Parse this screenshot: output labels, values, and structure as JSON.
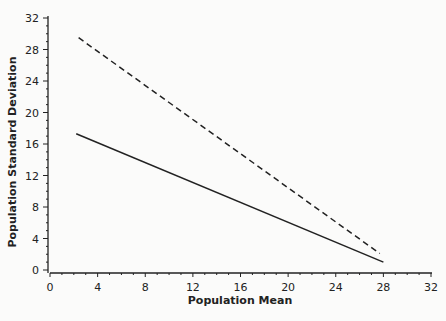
{
  "chart_data": {
    "type": "line",
    "title": "",
    "xlabel": "Population Mean",
    "ylabel": "Population Standard Deviation",
    "xlim": [
      0,
      32
    ],
    "ylim": [
      0,
      32
    ],
    "x_ticks": [
      0,
      4,
      8,
      12,
      16,
      20,
      24,
      28,
      32
    ],
    "y_ticks": [
      0,
      4,
      8,
      12,
      16,
      20,
      24,
      28,
      32
    ],
    "x_tick_labels": [
      "0",
      "4",
      "8",
      "12",
      "16",
      "20",
      "24",
      "28",
      "32"
    ],
    "y_tick_labels": [
      "0",
      "4",
      "8",
      "12",
      "16",
      "20",
      "24",
      "28",
      "32"
    ],
    "minor_tick_step": 1,
    "grid": false,
    "legend": null,
    "series": [
      {
        "name": "dashed",
        "style": "dashed",
        "color": "#222222",
        "x": [
          2.4,
          27.7
        ],
        "y": [
          29.5,
          2.1
        ]
      },
      {
        "name": "solid",
        "style": "solid",
        "color": "#222222",
        "x": [
          2.2,
          28.0
        ],
        "y": [
          17.3,
          1.0
        ]
      }
    ]
  },
  "plot_area": {
    "x0_px": 50,
    "x1_px": 431,
    "y0_px": 270,
    "y1_px": 18
  }
}
